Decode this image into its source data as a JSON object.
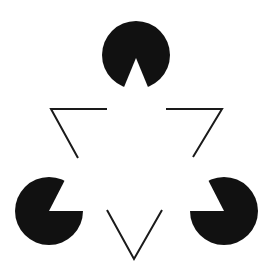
{
  "figure": {
    "width": 273,
    "height": 278,
    "background": "#ffffff",
    "ink": "#111111",
    "discs": [
      {
        "name": "top",
        "cx": 136,
        "cy": 55,
        "r": 34,
        "wedge": "M136,58 L124,89 L148,89 Z"
      },
      {
        "name": "bottom-left",
        "cx": 49,
        "cy": 211,
        "r": 34,
        "wedge": "M49,211 L66,180 L84,211 Z"
      },
      {
        "name": "bottom-right",
        "cx": 224,
        "cy": 211,
        "r": 34,
        "wedge": "M224,211 L189,211 L207,180 Z"
      }
    ],
    "outline_segments": [
      {
        "name": "left-v",
        "points": "107,109 51,109 78,158"
      },
      {
        "name": "right-v",
        "points": "166,109 222,109 193,157"
      },
      {
        "name": "bottom-v",
        "points": "107,210 134,259 162,210"
      }
    ],
    "stroke_width": 2
  }
}
